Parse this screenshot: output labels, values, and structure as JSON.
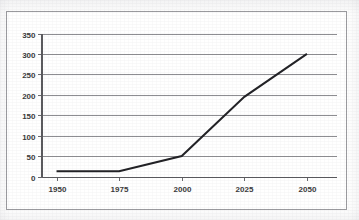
{
  "figure": {
    "clipped_title": "· · · · · · · · · ·",
    "frame_visible": true
  },
  "chart_data": {
    "type": "line",
    "title": "",
    "xlabel": "",
    "ylabel": "",
    "x": [
      1950,
      1975,
      2000,
      2025,
      2050
    ],
    "values": [
      13,
      13,
      50,
      195,
      300
    ],
    "series": [
      {
        "name": "series-1",
        "color": "#222226",
        "values": [
          13,
          13,
          50,
          195,
          300
        ]
      }
    ],
    "xlim": [
      1944,
      2062
    ],
    "ylim": [
      0,
      350
    ],
    "x_tick_labels": [
      "1950",
      "1975",
      "2000",
      "2025",
      "2050"
    ],
    "y_tick_labels": [
      "0",
      "50",
      "100",
      "150",
      "200",
      "250",
      "300",
      "350"
    ],
    "y_ticks": [
      0,
      50,
      100,
      150,
      200,
      250,
      300,
      350
    ],
    "grid": {
      "horizontal": true,
      "vertical": false,
      "color": "#8e8e92"
    },
    "legend": {
      "visible": false,
      "position": "none"
    },
    "axis_color": "#5a5a5e",
    "background": "#ffffff"
  }
}
